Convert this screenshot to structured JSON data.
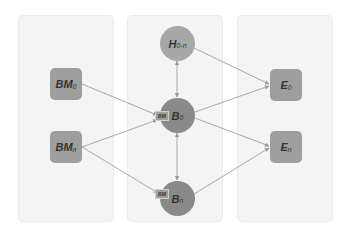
{
  "diagram": {
    "panels": [
      {
        "id": "left"
      },
      {
        "id": "middle"
      },
      {
        "id": "right"
      }
    ],
    "nodes": {
      "BM0": {
        "main": "BM",
        "sub": "0",
        "shape": "square"
      },
      "BMn": {
        "main": "BM",
        "sub": "n",
        "shape": "square"
      },
      "H0n": {
        "main": "H",
        "sub": "0-n",
        "shape": "circle"
      },
      "B0": {
        "main": "B",
        "sub": "0",
        "shape": "circle",
        "tag": "BM"
      },
      "Bn": {
        "main": "B",
        "sub": "n",
        "shape": "circle",
        "tag": "BM"
      },
      "E0": {
        "main": "E",
        "sub": "0",
        "shape": "square"
      },
      "En": {
        "main": "E",
        "sub": "n",
        "shape": "square"
      }
    },
    "edges": [
      {
        "from": "BM0",
        "to": "B0"
      },
      {
        "from": "BMn",
        "to": "B0"
      },
      {
        "from": "BMn",
        "to": "Bn"
      },
      {
        "from": "H0n",
        "to": "B0",
        "bidirectional": true
      },
      {
        "from": "B0",
        "to": "Bn",
        "bidirectional": true
      },
      {
        "from": "H0n",
        "to": "E0"
      },
      {
        "from": "B0",
        "to": "E0"
      },
      {
        "from": "B0",
        "to": "En"
      },
      {
        "from": "Bn",
        "to": "En"
      }
    ],
    "colors": {
      "panel_bg": "#f4f4f4",
      "square_fill": "#9e9e9e",
      "circle_light": "#a8a8a8",
      "circle_dark": "#8a8a8a",
      "edge": "#9a9a9a"
    }
  }
}
